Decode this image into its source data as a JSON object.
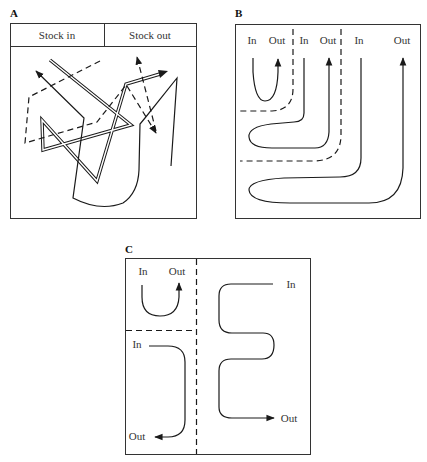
{
  "figure": {
    "panels": [
      {
        "id": "A",
        "label": "A",
        "header": [
          "Stock in",
          "Stock out"
        ],
        "description": "Disorganised flow: crossing solid, double and dashed routes with arrows"
      },
      {
        "id": "B",
        "label": "B",
        "zones": [
          {
            "in_label": "In",
            "out_label": "Out"
          },
          {
            "in_label": "In",
            "out_label": "Out"
          },
          {
            "in_label": "In",
            "out_label": "Out"
          }
        ],
        "description": "Nested U-shaped flows separated by dashed boundaries"
      },
      {
        "id": "C",
        "label": "C",
        "zones": [
          {
            "in_label": "In",
            "out_label": "Out"
          },
          {
            "in_label": "In",
            "out_label": "Out"
          },
          {
            "in_label": "In",
            "out_label": "Out"
          }
        ],
        "description": "Three zones: U-flow, L-flow and serpentine flow divided by dashed lines"
      }
    ]
  },
  "colors": {
    "line": "#1a1a1a",
    "frame": "#333333",
    "background": "#ffffff"
  }
}
